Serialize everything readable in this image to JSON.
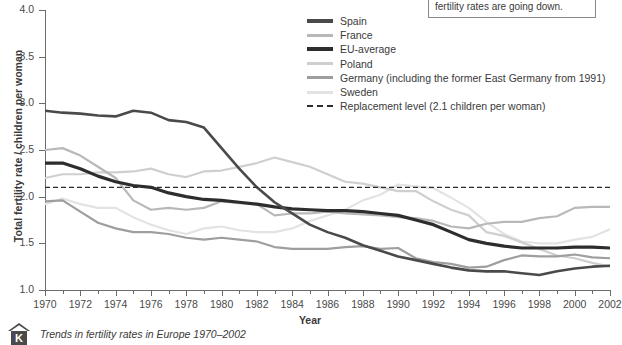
{
  "chart_data": {
    "type": "line",
    "title": "",
    "xlabel": "Year",
    "ylabel": "Total fertility rate / children per woman",
    "xlim": [
      1970,
      2002
    ],
    "ylim": [
      1.0,
      4.0
    ],
    "yticks": [
      "1.0",
      "1.5",
      "2.0",
      "2.5",
      "3.0",
      "3.5",
      "4.0"
    ],
    "xticks": [
      "1970",
      "1972",
      "1974",
      "1976",
      "1978",
      "1980",
      "1982",
      "1984",
      "1986",
      "1988",
      "1990",
      "1992",
      "1994",
      "1996",
      "1998",
      "2000",
      "2002"
    ],
    "grid": false,
    "legend_position": "top-center-right",
    "x": [
      1970,
      1971,
      1972,
      1973,
      1974,
      1975,
      1976,
      1977,
      1978,
      1979,
      1980,
      1981,
      1982,
      1983,
      1984,
      1985,
      1986,
      1987,
      1988,
      1989,
      1990,
      1991,
      1992,
      1993,
      1994,
      1995,
      1996,
      1997,
      1998,
      1999,
      2000,
      2001,
      2002
    ],
    "series": [
      {
        "name": "Spain",
        "color": "#4a4a4a",
        "width": 2.6,
        "values": [
          2.92,
          2.9,
          2.89,
          2.87,
          2.86,
          2.92,
          2.9,
          2.82,
          2.8,
          2.74,
          2.52,
          2.3,
          2.1,
          1.94,
          1.82,
          1.7,
          1.62,
          1.56,
          1.48,
          1.42,
          1.36,
          1.32,
          1.28,
          1.24,
          1.21,
          1.2,
          1.2,
          1.18,
          1.16,
          1.2,
          1.23,
          1.25,
          1.26
        ]
      },
      {
        "name": "France",
        "color": "#b8b8b8",
        "width": 2.2,
        "values": [
          2.5,
          2.52,
          2.44,
          2.32,
          2.2,
          1.96,
          1.86,
          1.88,
          1.86,
          1.88,
          1.95,
          1.93,
          1.92,
          1.8,
          1.82,
          1.82,
          1.84,
          1.82,
          1.81,
          1.8,
          1.78,
          1.77,
          1.74,
          1.68,
          1.66,
          1.71,
          1.73,
          1.73,
          1.77,
          1.79,
          1.88,
          1.89,
          1.89
        ]
      },
      {
        "name": "EU-average",
        "color": "#2d2d2d",
        "width": 3.2,
        "values": [
          2.36,
          2.36,
          2.3,
          2.22,
          2.16,
          2.12,
          2.1,
          2.04,
          2.0,
          1.97,
          1.96,
          1.94,
          1.92,
          1.89,
          1.87,
          1.86,
          1.85,
          1.85,
          1.84,
          1.82,
          1.8,
          1.75,
          1.7,
          1.62,
          1.54,
          1.5,
          1.47,
          1.45,
          1.45,
          1.45,
          1.46,
          1.46,
          1.45
        ]
      },
      {
        "name": "Poland",
        "color": "#cfcfcf",
        "width": 2.2,
        "values": [
          2.2,
          2.24,
          2.24,
          2.26,
          2.26,
          2.27,
          2.3,
          2.24,
          2.21,
          2.27,
          2.28,
          2.32,
          2.36,
          2.42,
          2.37,
          2.32,
          2.24,
          2.16,
          2.14,
          2.1,
          2.06,
          2.06,
          1.95,
          1.86,
          1.8,
          1.62,
          1.58,
          1.51,
          1.44,
          1.37,
          1.34,
          1.29,
          1.25
        ]
      },
      {
        "name": "Germany (including the former East Germany from 1991)",
        "color": "#9e9e9e",
        "width": 2.2,
        "values": [
          1.95,
          1.96,
          1.84,
          1.72,
          1.66,
          1.62,
          1.62,
          1.6,
          1.56,
          1.54,
          1.56,
          1.54,
          1.52,
          1.46,
          1.44,
          1.44,
          1.44,
          1.46,
          1.47,
          1.44,
          1.45,
          1.34,
          1.3,
          1.28,
          1.24,
          1.25,
          1.32,
          1.37,
          1.36,
          1.36,
          1.38,
          1.35,
          1.34
        ]
      },
      {
        "name": "Sweden",
        "color": "#e3e3e3",
        "width": 2.2,
        "values": [
          1.92,
          1.98,
          1.92,
          1.88,
          1.88,
          1.78,
          1.7,
          1.64,
          1.6,
          1.66,
          1.68,
          1.64,
          1.62,
          1.62,
          1.66,
          1.74,
          1.8,
          1.86,
          1.96,
          2.02,
          2.13,
          2.11,
          2.09,
          1.99,
          1.88,
          1.73,
          1.6,
          1.52,
          1.5,
          1.5,
          1.54,
          1.57,
          1.65
        ]
      }
    ],
    "reference_line": {
      "label": "Replacement level (2.1 children per woman)",
      "value": 2.1,
      "style": "dashed",
      "color": "#2d2d2d"
    }
  },
  "legend": {
    "items": [
      {
        "label": "Spain",
        "color": "#4a4a4a",
        "dashed": false
      },
      {
        "label": "France",
        "color": "#b8b8b8",
        "dashed": false
      },
      {
        "label": "EU-average",
        "color": "#2d2d2d",
        "dashed": false
      },
      {
        "label": "Poland",
        "color": "#cfcfcf",
        "dashed": false
      },
      {
        "label": "Germany (including the former East Germany from 1991)",
        "color": "#9e9e9e",
        "dashed": false
      },
      {
        "label": "Sweden",
        "color": "#e3e3e3",
        "dashed": false
      },
      {
        "label": "Replacement level (2.1 children per woman)",
        "color": "#2d2d2d",
        "dashed": true
      }
    ]
  },
  "callout": {
    "text": "fertility rates are going down."
  },
  "caption": {
    "logo_letter": "K",
    "text": "Trends in fertility rates in Europe 1970–2002"
  }
}
